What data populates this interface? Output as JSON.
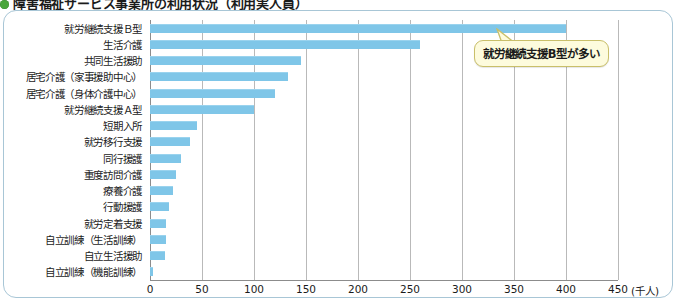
{
  "title": {
    "bullet_color": "#4aa63c",
    "text": "障害福祉サービス事業所の利用状況（利用実人員）"
  },
  "callout": {
    "text": "就労継続支援B型が多い",
    "fill": "#fdfbdd",
    "border": "#c9bf6a"
  },
  "chart_data": {
    "type": "bar",
    "orientation": "horizontal",
    "title": "障害福祉サービス事業所の利用状況（利用実人員）",
    "xlabel": "",
    "ylabel": "",
    "unit": "(千人)",
    "xlim": [
      0,
      450
    ],
    "xticks": [
      0,
      50,
      100,
      150,
      200,
      250,
      300,
      350,
      400,
      450
    ],
    "grid": true,
    "legend": null,
    "bar_color": "#7fc6e8",
    "annotations": [
      {
        "text": "就労継続支援B型が多い",
        "target": "就労継続支援Ｂ型"
      }
    ],
    "categories": [
      "就労継続支援Ｂ型",
      "生活介護",
      "共同生活援助",
      "居宅介護（家事援助中心）",
      "居宅介護（身体介護中心）",
      "就労継続支援Ａ型",
      "短期入所",
      "就労移行支援",
      "同行援護",
      "重度訪問介護",
      "療養介護",
      "行動援護",
      "就労定着支援",
      "自立訓練（生活訓練）",
      "自立生活援助",
      "自立訓練（機能訓練）"
    ],
    "values": [
      400,
      260,
      145,
      133,
      120,
      100,
      45,
      38,
      30,
      25,
      22,
      18,
      15,
      15,
      14,
      3
    ]
  }
}
